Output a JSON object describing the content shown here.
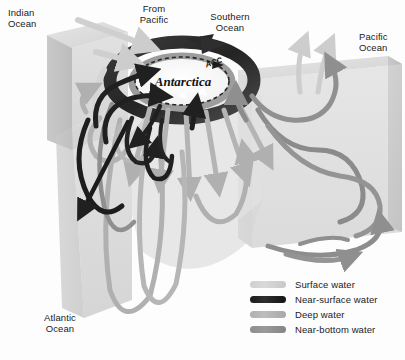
{
  "figure": {
    "center_label": "Antarctica",
    "current_label": "ACC",
    "ocean_labels": [
      {
        "id": "indian",
        "name": "Indian Ocean",
        "line1": "Indian",
        "line2": "Ocean"
      },
      {
        "id": "from-pacific",
        "name": "From Pacific",
        "line1": "From",
        "line2": "Pacific"
      },
      {
        "id": "southern",
        "name": "Southern Ocean",
        "line1": "Southern",
        "line2": "Ocean"
      },
      {
        "id": "pacific",
        "name": "Pacific Ocean",
        "line1": "Pacific",
        "line2": "Ocean"
      },
      {
        "id": "atlantic",
        "name": "Atlantic Ocean",
        "line1": "Atlantic",
        "line2": "Ocean"
      }
    ]
  },
  "legend": {
    "items": [
      {
        "label": "Surface water",
        "color": "#d4d4d4",
        "swatch": "sw-surface"
      },
      {
        "label": "Near-surface water",
        "color": "#222222",
        "swatch": "sw-nearsurface"
      },
      {
        "label": "Deep water",
        "color": "#b5b5b5",
        "swatch": "sw-deep"
      },
      {
        "label": "Near-bottom water",
        "color": "#929292",
        "swatch": "sw-nearbottom"
      }
    ]
  },
  "colors": {
    "surface_water": "#d4d4d4",
    "near_surface_water": "#222222",
    "deep_water": "#b5b5b5",
    "near_bottom_water": "#929292",
    "slab_top": "#dcdcdc",
    "slab_face": "#cfcfcf",
    "slab_side": "#c2c2c2",
    "background": "#fdfdfd",
    "text": "#1b1b1b"
  }
}
